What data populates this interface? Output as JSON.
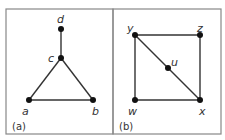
{
  "panels": [
    {
      "caption": "(a)",
      "nodes": [
        {
          "id": "d",
          "label": "d"
        },
        {
          "id": "c",
          "label": "c"
        },
        {
          "id": "a",
          "label": "a"
        },
        {
          "id": "b",
          "label": "b"
        }
      ],
      "edges": [
        [
          "d",
          "c"
        ],
        [
          "c",
          "a"
        ],
        [
          "c",
          "b"
        ],
        [
          "a",
          "b"
        ]
      ]
    },
    {
      "caption": "(b)",
      "nodes": [
        {
          "id": "y",
          "label": "y"
        },
        {
          "id": "z",
          "label": "z"
        },
        {
          "id": "u",
          "label": "u"
        },
        {
          "id": "w",
          "label": "w"
        },
        {
          "id": "x",
          "label": "x"
        }
      ],
      "edges": [
        [
          "y",
          "z"
        ],
        [
          "y",
          "w"
        ],
        [
          "z",
          "x"
        ],
        [
          "w",
          "x"
        ],
        [
          "y",
          "u"
        ],
        [
          "u",
          "x"
        ]
      ]
    }
  ],
  "colors": {
    "stroke": "#333333",
    "node": "#111111",
    "frame": "#888888"
  }
}
